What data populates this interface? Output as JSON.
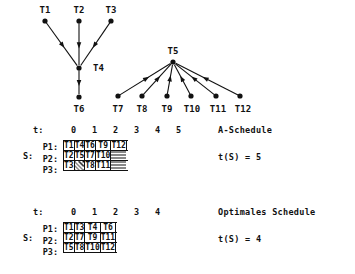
{
  "graph": {
    "title_nodes": [
      "T1",
      "T2",
      "T3",
      "T4",
      "T5",
      "T6",
      "T7",
      "T8",
      "T9",
      "T10",
      "T11",
      "T12"
    ],
    "tree_a": {
      "root_label": "T4",
      "parents": [
        "T1",
        "T2",
        "T3"
      ],
      "child": "T6"
    },
    "tree_b": {
      "root_label": "T5",
      "parents": [
        "T7",
        "T8",
        "T9",
        "T10",
        "T11",
        "T12"
      ]
    },
    "nodes": [
      {
        "id": "T1",
        "label": "T1",
        "x": 45,
        "y": 21,
        "label_x": 45,
        "label_y": 13
      },
      {
        "id": "T2",
        "label": "T2",
        "x": 79,
        "y": 21,
        "label_x": 79,
        "label_y": 13
      },
      {
        "id": "T3",
        "label": "T3",
        "x": 111,
        "y": 21,
        "label_x": 111,
        "label_y": 13
      },
      {
        "id": "T4",
        "label": "T4",
        "x": 79,
        "y": 68,
        "label_x": 93,
        "label_y": 71
      },
      {
        "id": "T6",
        "label": "T6",
        "x": 79,
        "y": 97,
        "label_x": 79,
        "label_y": 112
      },
      {
        "id": "T5",
        "label": "T5",
        "x": 173,
        "y": 62,
        "label_x": 173,
        "label_y": 54
      },
      {
        "id": "T7",
        "label": "T7",
        "x": 118,
        "y": 96,
        "label_x": 118,
        "label_y": 112
      },
      {
        "id": "T8",
        "label": "T8",
        "x": 142,
        "y": 96,
        "label_x": 142,
        "label_y": 112
      },
      {
        "id": "T9",
        "label": "T9",
        "x": 167,
        "y": 96,
        "label_x": 167,
        "label_y": 112
      },
      {
        "id": "T10",
        "label": "T10",
        "x": 191,
        "y": 96,
        "label_x": 192,
        "label_y": 112
      },
      {
        "id": "T11",
        "label": "T11",
        "x": 216,
        "y": 96,
        "label_x": 218,
        "label_y": 112
      },
      {
        "id": "T12",
        "label": "T12",
        "x": 240,
        "y": 96,
        "label_x": 243,
        "label_y": 112
      }
    ],
    "edges": [
      {
        "from": "T1",
        "to": "T4"
      },
      {
        "from": "T2",
        "to": "T4"
      },
      {
        "from": "T3",
        "to": "T4"
      },
      {
        "from": "T4",
        "to": "T6"
      },
      {
        "from": "T7",
        "to": "T5"
      },
      {
        "from": "T8",
        "to": "T5"
      },
      {
        "from": "T9",
        "to": "T5"
      },
      {
        "from": "T10",
        "to": "T5"
      },
      {
        "from": "T11",
        "to": "T5"
      },
      {
        "from": "T12",
        "to": "T5"
      }
    ]
  },
  "schedule_a": {
    "time_label": "t:",
    "ticks": [
      "0",
      "1",
      "2",
      "3",
      "4",
      "5"
    ],
    "s_label": "S:",
    "processors": [
      "P1:",
      "P2:",
      "P3:"
    ],
    "rows": [
      [
        "T1",
        "T4",
        "T6",
        "T9",
        "T12"
      ],
      [
        "T2",
        "T5",
        "T7",
        "T10",
        ""
      ],
      [
        "T3",
        "",
        "T8",
        "T11",
        ""
      ]
    ],
    "idle_cells": [
      [
        2,
        1
      ]
    ],
    "tail_cells": [
      [
        1,
        4
      ],
      [
        2,
        4
      ]
    ],
    "caption": "A-Schedule",
    "cost": "t(S) = 5"
  },
  "schedule_b": {
    "time_label": "t:",
    "ticks": [
      "0",
      "1",
      "2",
      "3",
      "4"
    ],
    "s_label": "S:",
    "processors": [
      "P1:",
      "P2:",
      "P3:"
    ],
    "rows": [
      [
        "T1",
        "T3",
        "T4",
        "T6"
      ],
      [
        "T2",
        "T7",
        "T9",
        "T11"
      ],
      [
        "T5",
        "T8",
        "T10",
        "T12"
      ]
    ],
    "idle_cells": [],
    "tail_cells": [],
    "caption": "Optimales Schedule",
    "cost": "t(S) = 4"
  },
  "colors": {
    "ink": "#111111",
    "paper": "#ffffff"
  }
}
